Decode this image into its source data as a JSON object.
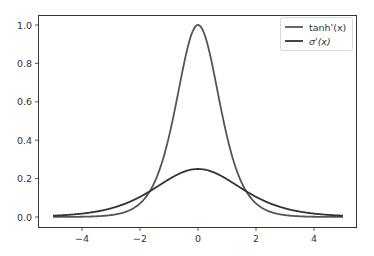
{
  "chart_data": {
    "type": "line",
    "title": "",
    "xlabel": "",
    "ylabel": "",
    "xlim": [
      -5.5,
      5.5
    ],
    "ylim": [
      -0.05,
      1.05
    ],
    "grid": false,
    "legend_position": "upper right",
    "x_ticks": [
      "-4",
      "-2",
      "0",
      "2",
      "4"
    ],
    "y_ticks": [
      "0.0",
      "0.2",
      "0.4",
      "0.6",
      "0.8",
      "1.0"
    ],
    "x_range": [
      -5,
      5
    ],
    "series": [
      {
        "name": "tanh'(x)",
        "color": "#555555",
        "function": "1 - tanh(x)^2",
        "peak": {
          "x": 0,
          "y": 1.0
        }
      },
      {
        "name": "σ'(x)",
        "color": "#333333",
        "function": "sigmoid(x)*(1-sigmoid(x))",
        "peak": {
          "x": 0,
          "y": 0.25
        }
      }
    ]
  },
  "legend": {
    "items": [
      {
        "label": "tanh'(x)"
      },
      {
        "label": "σ'(x)"
      }
    ]
  }
}
